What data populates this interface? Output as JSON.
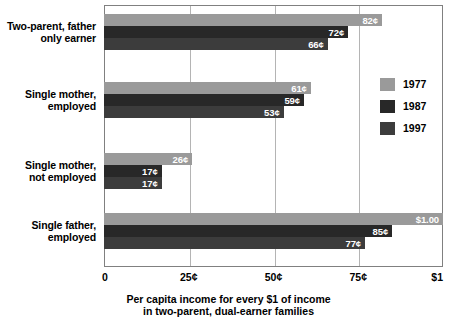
{
  "chart_data": {
    "type": "bar",
    "orientation": "horizontal",
    "title": "",
    "xlabel_line1": "Per capita income for every $1 of income",
    "xlabel_line2": "in two-parent, dual-earner families",
    "ylabel": "",
    "xlim": [
      0,
      100
    ],
    "grid": true,
    "legend_position": "right",
    "xtick_values": [
      0,
      25,
      50,
      75,
      100
    ],
    "xtick_labels": [
      "0",
      "25¢",
      "50¢",
      "75¢",
      "$1"
    ],
    "categories": [
      "Two-parent, father only earner",
      "Single mother, employed",
      "Single mother, not employed",
      "Single father, employed"
    ],
    "category_lines": [
      [
        "Two-parent, father",
        "only earner"
      ],
      [
        "Single mother,",
        "employed"
      ],
      [
        "Single mother,",
        "not employed"
      ],
      [
        "Single father,",
        "employed"
      ]
    ],
    "series": [
      {
        "name": "1977",
        "color": "#9a9a9a",
        "values": [
          82,
          61,
          26,
          100
        ],
        "labels": [
          "82¢",
          "61¢",
          "26¢",
          "$1.00"
        ]
      },
      {
        "name": "1987",
        "color": "#282828",
        "values": [
          72,
          59,
          17,
          85
        ],
        "labels": [
          "72¢",
          "59¢",
          "17¢",
          "85¢"
        ]
      },
      {
        "name": "1997",
        "color": "#3c3c3c",
        "values": [
          66,
          53,
          17,
          77
        ],
        "labels": [
          "66¢",
          "53¢",
          "17¢",
          "77¢"
        ]
      }
    ]
  },
  "legend": {
    "items": [
      {
        "label": "1977",
        "color": "#9a9a9a"
      },
      {
        "label": "1987",
        "color": "#282828"
      },
      {
        "label": "1997",
        "color": "#3c3c3c"
      }
    ]
  }
}
